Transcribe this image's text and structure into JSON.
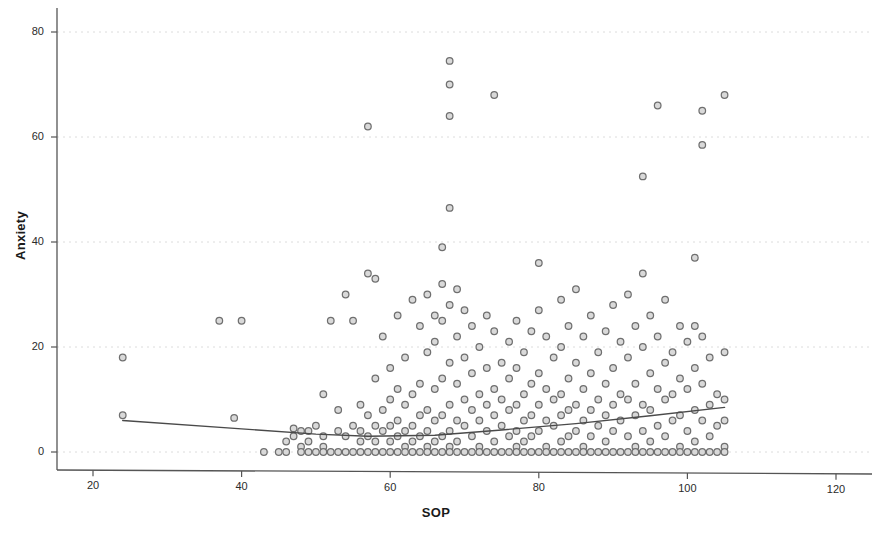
{
  "chart_data": {
    "type": "scatter",
    "title": "",
    "subtitle": "",
    "xlabel": "SOP",
    "ylabel": "Anxiety",
    "xlim": [
      13,
      128
    ],
    "ylim": [
      -3,
      84
    ],
    "xticks": [
      20,
      40,
      60,
      80,
      100,
      120
    ],
    "yticks": [
      0,
      20,
      40,
      60,
      80
    ],
    "grid": "horizontal-dotted",
    "legend": "none",
    "marker": {
      "shape": "circle-open",
      "size_px": 8,
      "edge_color": "#6f6f6f",
      "fill_color": "#d9d9d9"
    },
    "fit_line": {
      "name": "fit-line",
      "color": "#4a4a4a",
      "width_px": 1.4,
      "points": [
        [
          24,
          6.0
        ],
        [
          40,
          4.4
        ],
        [
          50,
          3.4
        ],
        [
          57,
          3.0
        ],
        [
          66,
          3.2
        ],
        [
          75,
          4.2
        ],
        [
          85,
          5.4
        ],
        [
          95,
          6.9
        ],
        [
          105,
          8.5
        ]
      ]
    },
    "series": [
      {
        "name": "participants",
        "points": [
          [
            24,
            18
          ],
          [
            24,
            7
          ],
          [
            37,
            25
          ],
          [
            40,
            25
          ],
          [
            39,
            6.5
          ],
          [
            43,
            0
          ],
          [
            45,
            0
          ],
          [
            46,
            2
          ],
          [
            46,
            0
          ],
          [
            47,
            3
          ],
          [
            47,
            4.5
          ],
          [
            48,
            4
          ],
          [
            48,
            1
          ],
          [
            48,
            0
          ],
          [
            49,
            4
          ],
          [
            49,
            2
          ],
          [
            49,
            0
          ],
          [
            50,
            5
          ],
          [
            50,
            0
          ],
          [
            51,
            11
          ],
          [
            51,
            3
          ],
          [
            51,
            1
          ],
          [
            51,
            0
          ],
          [
            52,
            25
          ],
          [
            52,
            0
          ],
          [
            53,
            8
          ],
          [
            53,
            4
          ],
          [
            53,
            0
          ],
          [
            54,
            30
          ],
          [
            54,
            3
          ],
          [
            54,
            0
          ],
          [
            55,
            25
          ],
          [
            55,
            5
          ],
          [
            55,
            0
          ],
          [
            56,
            9
          ],
          [
            56,
            4
          ],
          [
            56,
            2
          ],
          [
            56,
            0
          ],
          [
            57,
            62
          ],
          [
            57,
            34
          ],
          [
            57,
            7
          ],
          [
            57,
            3
          ],
          [
            57,
            0
          ],
          [
            58,
            33
          ],
          [
            58,
            14
          ],
          [
            58,
            5
          ],
          [
            58,
            2
          ],
          [
            58,
            0
          ],
          [
            59,
            22
          ],
          [
            59,
            8
          ],
          [
            59,
            4
          ],
          [
            59,
            0
          ],
          [
            60,
            16
          ],
          [
            60,
            10
          ],
          [
            60,
            5
          ],
          [
            60,
            2
          ],
          [
            60,
            0
          ],
          [
            61,
            26
          ],
          [
            61,
            12
          ],
          [
            61,
            6
          ],
          [
            61,
            3
          ],
          [
            61,
            0
          ],
          [
            62,
            18
          ],
          [
            62,
            9
          ],
          [
            62,
            4
          ],
          [
            62,
            1
          ],
          [
            62,
            0
          ],
          [
            63,
            29
          ],
          [
            63,
            11
          ],
          [
            63,
            5
          ],
          [
            63,
            2
          ],
          [
            63,
            0
          ],
          [
            64,
            24
          ],
          [
            64,
            13
          ],
          [
            64,
            7
          ],
          [
            64,
            3
          ],
          [
            64,
            0
          ],
          [
            65,
            30
          ],
          [
            65,
            19
          ],
          [
            65,
            8
          ],
          [
            65,
            4
          ],
          [
            65,
            1
          ],
          [
            65,
            0
          ],
          [
            66,
            26
          ],
          [
            66,
            21
          ],
          [
            66,
            12
          ],
          [
            66,
            6
          ],
          [
            66,
            2
          ],
          [
            66,
            0
          ],
          [
            67,
            39
          ],
          [
            67,
            32
          ],
          [
            67,
            25
          ],
          [
            67,
            14
          ],
          [
            67,
            7
          ],
          [
            67,
            3
          ],
          [
            67,
            0
          ],
          [
            68,
            74.5
          ],
          [
            68,
            70
          ],
          [
            68,
            64
          ],
          [
            68,
            46.5
          ],
          [
            68,
            28
          ],
          [
            68,
            17
          ],
          [
            68,
            9
          ],
          [
            68,
            4
          ],
          [
            68,
            1
          ],
          [
            68,
            0
          ],
          [
            69,
            31
          ],
          [
            69,
            22
          ],
          [
            69,
            13
          ],
          [
            69,
            6
          ],
          [
            69,
            2
          ],
          [
            69,
            0
          ],
          [
            70,
            27
          ],
          [
            70,
            18
          ],
          [
            70,
            10
          ],
          [
            70,
            5
          ],
          [
            70,
            0
          ],
          [
            71,
            24
          ],
          [
            71,
            15
          ],
          [
            71,
            8
          ],
          [
            71,
            3
          ],
          [
            71,
            0
          ],
          [
            72,
            20
          ],
          [
            72,
            11
          ],
          [
            72,
            6
          ],
          [
            72,
            1
          ],
          [
            72,
            0
          ],
          [
            73,
            26
          ],
          [
            73,
            16
          ],
          [
            73,
            9
          ],
          [
            73,
            4
          ],
          [
            73,
            0
          ],
          [
            74,
            68
          ],
          [
            74,
            23
          ],
          [
            74,
            12
          ],
          [
            74,
            7
          ],
          [
            74,
            2
          ],
          [
            74,
            0
          ],
          [
            75,
            17
          ],
          [
            75,
            10
          ],
          [
            75,
            5
          ],
          [
            75,
            0
          ],
          [
            76,
            21
          ],
          [
            76,
            14
          ],
          [
            76,
            8
          ],
          [
            76,
            3
          ],
          [
            76,
            0
          ],
          [
            77,
            25
          ],
          [
            77,
            16
          ],
          [
            77,
            9
          ],
          [
            77,
            4
          ],
          [
            77,
            1
          ],
          [
            77,
            0
          ],
          [
            78,
            19
          ],
          [
            78,
            11
          ],
          [
            78,
            6
          ],
          [
            78,
            2
          ],
          [
            78,
            0
          ],
          [
            79,
            23
          ],
          [
            79,
            13
          ],
          [
            79,
            7
          ],
          [
            79,
            3
          ],
          [
            79,
            0
          ],
          [
            80,
            36
          ],
          [
            80,
            27
          ],
          [
            80,
            15
          ],
          [
            80,
            9
          ],
          [
            80,
            4
          ],
          [
            80,
            0
          ],
          [
            81,
            22
          ],
          [
            81,
            12
          ],
          [
            81,
            6
          ],
          [
            81,
            1
          ],
          [
            81,
            0
          ],
          [
            82,
            18
          ],
          [
            82,
            10
          ],
          [
            82,
            5
          ],
          [
            82,
            0
          ],
          [
            83,
            29
          ],
          [
            83,
            20
          ],
          [
            83,
            11
          ],
          [
            83,
            7
          ],
          [
            83,
            2
          ],
          [
            83,
            0
          ],
          [
            84,
            24
          ],
          [
            84,
            14
          ],
          [
            84,
            8
          ],
          [
            84,
            3
          ],
          [
            84,
            0
          ],
          [
            85,
            31
          ],
          [
            85,
            17
          ],
          [
            85,
            9
          ],
          [
            85,
            4
          ],
          [
            85,
            0
          ],
          [
            86,
            22
          ],
          [
            86,
            12
          ],
          [
            86,
            6
          ],
          [
            86,
            1
          ],
          [
            86,
            0
          ],
          [
            87,
            26
          ],
          [
            87,
            15
          ],
          [
            87,
            8
          ],
          [
            87,
            3
          ],
          [
            87,
            0
          ],
          [
            88,
            19
          ],
          [
            88,
            10
          ],
          [
            88,
            5
          ],
          [
            88,
            0
          ],
          [
            89,
            23
          ],
          [
            89,
            13
          ],
          [
            89,
            7
          ],
          [
            89,
            2
          ],
          [
            89,
            0
          ],
          [
            90,
            28
          ],
          [
            90,
            16
          ],
          [
            90,
            9
          ],
          [
            90,
            4
          ],
          [
            90,
            0
          ],
          [
            91,
            21
          ],
          [
            91,
            11
          ],
          [
            91,
            6
          ],
          [
            91,
            0
          ],
          [
            92,
            30
          ],
          [
            92,
            18
          ],
          [
            92,
            10
          ],
          [
            92,
            3
          ],
          [
            92,
            0
          ],
          [
            93,
            24
          ],
          [
            93,
            13
          ],
          [
            93,
            7
          ],
          [
            93,
            1
          ],
          [
            93,
            0
          ],
          [
            94,
            52.5
          ],
          [
            94,
            34
          ],
          [
            94,
            20
          ],
          [
            94,
            9
          ],
          [
            94,
            4
          ],
          [
            94,
            0
          ],
          [
            95,
            26
          ],
          [
            95,
            15
          ],
          [
            95,
            8
          ],
          [
            95,
            2
          ],
          [
            95,
            0
          ],
          [
            96,
            66
          ],
          [
            96,
            22
          ],
          [
            96,
            12
          ],
          [
            96,
            5
          ],
          [
            96,
            0
          ],
          [
            97,
            29
          ],
          [
            97,
            17
          ],
          [
            97,
            10
          ],
          [
            97,
            3
          ],
          [
            97,
            0
          ],
          [
            98,
            19
          ],
          [
            98,
            11
          ],
          [
            98,
            6
          ],
          [
            98,
            0
          ],
          [
            99,
            24
          ],
          [
            99,
            14
          ],
          [
            99,
            7
          ],
          [
            99,
            1
          ],
          [
            99,
            0
          ],
          [
            100,
            21
          ],
          [
            100,
            12
          ],
          [
            100,
            4
          ],
          [
            100,
            0
          ],
          [
            101,
            37
          ],
          [
            101,
            24
          ],
          [
            101,
            16
          ],
          [
            101,
            8
          ],
          [
            101,
            2
          ],
          [
            101,
            0
          ],
          [
            102,
            65
          ],
          [
            102,
            58.5
          ],
          [
            102,
            22
          ],
          [
            102,
            13
          ],
          [
            102,
            6
          ],
          [
            102,
            0
          ],
          [
            103,
            18
          ],
          [
            103,
            9
          ],
          [
            103,
            3
          ],
          [
            103,
            0
          ],
          [
            104,
            11
          ],
          [
            104,
            5
          ],
          [
            104,
            0
          ],
          [
            105,
            68
          ],
          [
            105,
            19
          ],
          [
            105,
            10
          ],
          [
            105,
            6
          ],
          [
            105,
            1
          ],
          [
            105,
            0
          ]
        ]
      }
    ]
  },
  "axes": {
    "x_tick_labels": [
      "20",
      "40",
      "60",
      "80",
      "100",
      "120"
    ],
    "y_tick_labels": [
      "0",
      "20",
      "40",
      "60",
      "80"
    ],
    "x_axis_title": "SOP",
    "y_axis_title": "Anxiety"
  },
  "colors": {
    "background": "#ffffff",
    "axis_line": "#555555",
    "grid_line": "#dcdcdc",
    "marker_edge": "#6f6f6f",
    "marker_fill": "#d9d9d9",
    "fit_line": "#4a4a4a",
    "text": "#1b1b1b"
  }
}
